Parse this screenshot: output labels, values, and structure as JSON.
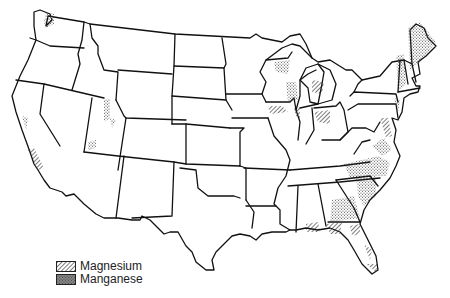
{
  "map": {
    "subject": "Conterminous United States",
    "style": "black-and-white line map with state boundaries"
  },
  "legend": {
    "items": [
      {
        "label": "Magnesium",
        "pattern": "diagonal-hatch",
        "color": "#333333"
      },
      {
        "label": "Manganese",
        "pattern": "stipple-dots",
        "color": "#555555"
      }
    ]
  },
  "deposits": {
    "magnesium": [
      "California coast",
      "Michigan lower peninsula",
      "Indiana/Ohio",
      "Maryland/Chesapeake",
      "Florida panhandle & peninsula",
      "Wisconsin/Illinois"
    ],
    "manganese": [
      "Washington",
      "Utah",
      "Nevada/Arizona",
      "Wisconsin",
      "Vermont/New Hampshire",
      "Maine",
      "Virginia/North Carolina",
      "South Carolina/Georgia",
      "New Jersey/New York"
    ]
  }
}
